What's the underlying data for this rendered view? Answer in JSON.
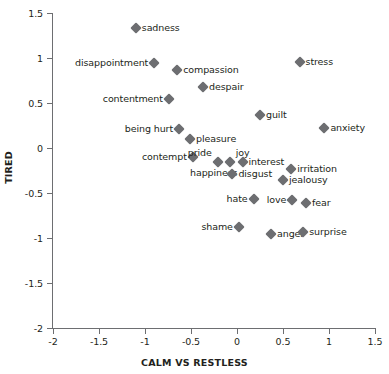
{
  "chart_data": {
    "type": "scatter",
    "title": "",
    "xlabel": "CALM VS RESTLESS",
    "ylabel": "TIRED",
    "xlim": [
      -2,
      1.5
    ],
    "ylim": [
      -2,
      1.5
    ],
    "xticks": [
      "-2",
      "-1.5",
      "-1",
      "-0.5",
      "0",
      "0.5",
      "1",
      "1.5"
    ],
    "xtick_values": [
      -2,
      -1.5,
      -1,
      -0.5,
      0,
      0.5,
      1,
      1.5
    ],
    "yticks": [
      "1.5",
      "1",
      "0.5",
      "0",
      "-0.5",
      "-1",
      "-1.5",
      "-2"
    ],
    "ytick_values": [
      1.5,
      1,
      0.5,
      0,
      -0.5,
      -1,
      -1.5,
      -2
    ],
    "grid": false,
    "legend": "none",
    "marker": "diamond",
    "marker_color": "#6d6e71",
    "points": [
      {
        "label": "sadness",
        "x": -1.1,
        "y": 1.33,
        "label_pos": "right"
      },
      {
        "label": "disappointment",
        "x": -0.9,
        "y": 0.94,
        "label_pos": "left"
      },
      {
        "label": "compassion",
        "x": -0.65,
        "y": 0.87,
        "label_pos": "right"
      },
      {
        "label": "despair",
        "x": -0.37,
        "y": 0.68,
        "label_pos": "right"
      },
      {
        "label": "contentment",
        "x": -0.74,
        "y": 0.54,
        "label_pos": "left"
      },
      {
        "label": "stress",
        "x": 0.68,
        "y": 0.96,
        "label_pos": "right"
      },
      {
        "label": "guilt",
        "x": 0.25,
        "y": 0.37,
        "label_pos": "right"
      },
      {
        "label": "anxiety",
        "x": 0.95,
        "y": 0.22,
        "label_pos": "right"
      },
      {
        "label": "being hurt",
        "x": -0.63,
        "y": 0.21,
        "label_pos": "left"
      },
      {
        "label": "pleasure",
        "x": -0.51,
        "y": 0.1,
        "label_pos": "right"
      },
      {
        "label": "contempt",
        "x": -0.48,
        "y": -0.1,
        "label_pos": "left"
      },
      {
        "label": "pride",
        "x": -0.21,
        "y": -0.15,
        "label_pos": "above-left"
      },
      {
        "label": "joy",
        "x": -0.08,
        "y": -0.15,
        "label_pos": "above"
      },
      {
        "label": "interest",
        "x": 0.06,
        "y": -0.15,
        "label_pos": "right"
      },
      {
        "label": "happiness",
        "x": -0.38,
        "y": -0.15,
        "label_pos": "happiness"
      },
      {
        "label": "disgust",
        "x": -0.05,
        "y": -0.29,
        "label_pos": "right"
      },
      {
        "label": "irritation",
        "x": 0.59,
        "y": -0.23,
        "label_pos": "right"
      },
      {
        "label": "jealousy",
        "x": 0.5,
        "y": -0.36,
        "label_pos": "right"
      },
      {
        "label": "hate",
        "x": 0.18,
        "y": -0.57,
        "label_pos": "left"
      },
      {
        "label": "love",
        "x": 0.6,
        "y": -0.58,
        "label_pos": "left"
      },
      {
        "label": "fear",
        "x": 0.75,
        "y": -0.61,
        "label_pos": "right"
      },
      {
        "label": "shame",
        "x": 0.02,
        "y": -0.88,
        "label_pos": "left"
      },
      {
        "label": "anger",
        "x": 0.37,
        "y": -0.96,
        "label_pos": "right"
      },
      {
        "label": "surprise",
        "x": 0.72,
        "y": -0.93,
        "label_pos": "right"
      }
    ]
  },
  "caption": {
    "cut_off_text": ""
  }
}
